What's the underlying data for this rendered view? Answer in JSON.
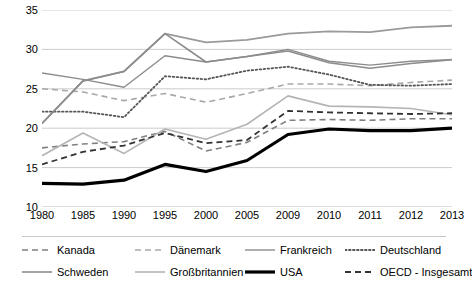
{
  "chart_data": {
    "type": "line",
    "title": "",
    "xlabel": "",
    "ylabel": "",
    "categories": [
      "1980",
      "1985",
      "1990",
      "1995",
      "2000",
      "2005",
      "2009",
      "2010",
      "2011",
      "2012",
      "2013"
    ],
    "ylim": [
      10,
      35
    ],
    "yticks": [
      "10",
      "15",
      "20",
      "25",
      "30",
      "35"
    ],
    "grid": "horizontal",
    "legend_position": "bottom",
    "series": [
      {
        "name": "Kanada",
        "color": "#808080",
        "style": "dashed",
        "width": 1.6,
        "values": [
          17.5,
          18.0,
          18.3,
          19.6,
          17.1,
          18.2,
          21.0,
          21.1,
          21.0,
          21.2,
          21.2
        ]
      },
      {
        "name": "Dänemark",
        "color": "#a8a8a8",
        "style": "dashed",
        "width": 1.6,
        "values": [
          25.0,
          24.6,
          23.5,
          24.4,
          23.3,
          24.4,
          25.6,
          25.6,
          25.4,
          25.8,
          26.1
        ]
      },
      {
        "name": "Frankreich",
        "color": "#8c8c8c",
        "style": "solid",
        "width": 1.4,
        "values": [
          27.0,
          26.2,
          25.2,
          29.2,
          28.4,
          29.1,
          30.0,
          28.5,
          28.0,
          28.5,
          28.7
        ]
      },
      {
        "name": "Deutschland",
        "color": "#555555",
        "style": "dotted",
        "width": 1.8,
        "values": [
          22.1,
          22.1,
          21.4,
          26.6,
          26.2,
          27.3,
          27.8,
          26.8,
          25.5,
          25.4,
          25.6
        ]
      },
      {
        "name": "Schweden",
        "color": "#8c8c8c",
        "style": "solid",
        "width": 1.6,
        "values": [
          20.6,
          26.0,
          27.2,
          32.0,
          28.4,
          29.1,
          29.8,
          28.3,
          27.6,
          28.2,
          28.7
        ]
      },
      {
        "name": "Großbritannien",
        "color": "#b4b4b4",
        "style": "solid",
        "width": 1.6,
        "values": [
          16.5,
          19.4,
          16.8,
          19.9,
          18.6,
          20.5,
          24.1,
          22.8,
          22.7,
          22.5,
          21.7
        ]
      },
      {
        "name": "USA",
        "color": "#000000",
        "style": "solid",
        "width": 3.2,
        "values": [
          13.0,
          12.9,
          13.4,
          15.4,
          14.5,
          15.9,
          19.2,
          19.9,
          19.7,
          19.7,
          20.0
        ]
      },
      {
        "name": "OECD - Insgesamt",
        "color": "#333333",
        "style": "dashed",
        "width": 1.8,
        "values": [
          15.4,
          17.0,
          17.8,
          19.4,
          18.1,
          18.5,
          22.2,
          22.0,
          21.9,
          21.8,
          21.9
        ]
      }
    ],
    "top_series_note": {
      "name": "Schweden-upper",
      "color": "#9a9a9a",
      "values": [
        20.6,
        26.0,
        27.2,
        32.0,
        30.9,
        31.2,
        32.0,
        32.3,
        32.2,
        32.8,
        33.0
      ]
    }
  },
  "legend": {
    "items": [
      {
        "label": "Kanada",
        "icon": "dashed-line-swatch"
      },
      {
        "label": "Dänemark",
        "icon": "dashed-line-swatch"
      },
      {
        "label": "Frankreich",
        "icon": "solid-line-swatch"
      },
      {
        "label": "Deutschland",
        "icon": "dotted-line-swatch"
      },
      {
        "label": "Schweden",
        "icon": "solid-line-swatch"
      },
      {
        "label": "Großbritannien",
        "icon": "solid-line-swatch"
      },
      {
        "label": "USA",
        "icon": "thick-solid-line-swatch"
      },
      {
        "label": "OECD - Insgesamt",
        "icon": "dashed-line-swatch"
      }
    ]
  }
}
